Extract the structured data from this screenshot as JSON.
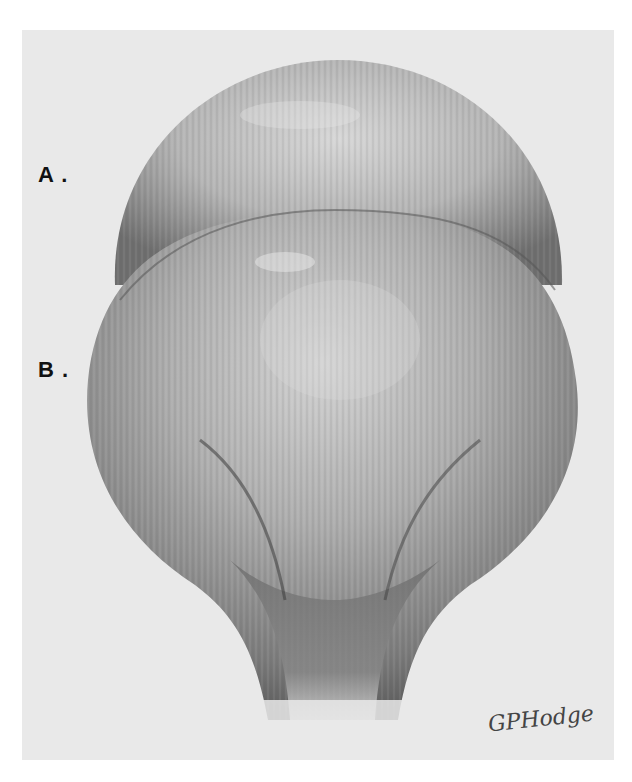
{
  "figure": {
    "labels": [
      {
        "id": "A",
        "text": "A ."
      },
      {
        "id": "B",
        "text": "B ."
      }
    ],
    "signature": "GPHodge",
    "colors": {
      "background": "#e9e9e9",
      "lobe_light": "#cfcfcf",
      "lobe_mid": "#9a9a9a",
      "lobe_dark": "#5a5a5a",
      "label": "#111111"
    }
  }
}
